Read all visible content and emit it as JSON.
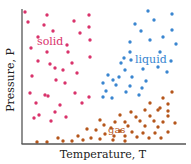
{
  "colors": {
    "solid": "#d9336b",
    "liquid": "#3a86d0",
    "gas": "#b5561b",
    "axis": "#555555",
    "text": "#222222"
  },
  "labels": {
    "solid": "solid",
    "liquid": "liquid",
    "gas": "gas"
  },
  "chart_data": {
    "type": "scatter",
    "title": "",
    "xlabel": "Temperature, T",
    "ylabel": "Pressure, P",
    "grid": false,
    "legend": "in-plot text labels",
    "series": [
      {
        "name": "solid",
        "points": [
          [
            25,
            12
          ],
          [
            47,
            15
          ],
          [
            89,
            15
          ],
          [
            28,
            22
          ],
          [
            44,
            25
          ],
          [
            74,
            21
          ],
          [
            89,
            27
          ],
          [
            53,
            31
          ],
          [
            80,
            33
          ],
          [
            38,
            37
          ],
          [
            67,
            45
          ],
          [
            90,
            40
          ],
          [
            31,
            48
          ],
          [
            47,
            52
          ],
          [
            68,
            52
          ],
          [
            90,
            57
          ],
          [
            38,
            61
          ],
          [
            50,
            64
          ],
          [
            72,
            63
          ],
          [
            55,
            68
          ],
          [
            63,
            70
          ],
          [
            77,
            73
          ],
          [
            32,
            76
          ],
          [
            56,
            80
          ],
          [
            65,
            83
          ],
          [
            30,
            93
          ],
          [
            45,
            95
          ],
          [
            75,
            93
          ],
          [
            48,
            96
          ],
          [
            36,
            103
          ],
          [
            60,
            105
          ],
          [
            82,
            103
          ],
          [
            89,
            97
          ],
          [
            55,
            112
          ],
          [
            39,
            115
          ],
          [
            34,
            118
          ],
          [
            66,
            117
          ],
          [
            51,
            121
          ]
        ]
      },
      {
        "name": "liquid",
        "points": [
          [
            148,
            11
          ],
          [
            172,
            14
          ],
          [
            154,
            20
          ],
          [
            135,
            24
          ],
          [
            141,
            31
          ],
          [
            172,
            30
          ],
          [
            150,
            40
          ],
          [
            163,
            37
          ],
          [
            130,
            42
          ],
          [
            176,
            44
          ],
          [
            130,
            52
          ],
          [
            160,
            52
          ],
          [
            124,
            58
          ],
          [
            131,
            60
          ],
          [
            171,
            61
          ],
          [
            121,
            63
          ],
          [
            143,
            69
          ],
          [
            125,
            70
          ],
          [
            158,
            67
          ],
          [
            167,
            72
          ],
          [
            108,
            75
          ],
          [
            119,
            77
          ],
          [
            132,
            77
          ],
          [
            146,
            81
          ],
          [
            113,
            80
          ],
          [
            103,
            83
          ],
          [
            116,
            85
          ],
          [
            130,
            86
          ],
          [
            142,
            88
          ],
          [
            106,
            91
          ],
          [
            126,
            92
          ],
          [
            139,
            95
          ],
          [
            103,
            97
          ],
          [
            112,
            98
          ]
        ]
      },
      {
        "name": "gas",
        "points": [
          [
            172,
            92
          ],
          [
            163,
            98
          ],
          [
            168,
            104
          ],
          [
            150,
            103
          ],
          [
            160,
            108
          ],
          [
            131,
            112
          ],
          [
            145,
            110
          ],
          [
            158,
            110
          ],
          [
            168,
            111
          ],
          [
            120,
            115
          ],
          [
            136,
            117
          ],
          [
            150,
            116
          ],
          [
            168,
            116
          ],
          [
            100,
            120
          ],
          [
            115,
            122
          ],
          [
            125,
            122
          ],
          [
            140,
            121
          ],
          [
            154,
            121
          ],
          [
            163,
            122
          ],
          [
            175,
            123
          ],
          [
            104,
            125
          ],
          [
            128,
            126
          ],
          [
            145,
            126
          ],
          [
            158,
            127
          ],
          [
            111,
            128
          ],
          [
            87,
            129
          ],
          [
            96,
            130
          ],
          [
            120,
            131
          ],
          [
            132,
            132
          ],
          [
            143,
            133
          ],
          [
            155,
            133
          ],
          [
            168,
            132
          ],
          [
            105,
            134
          ],
          [
            114,
            136
          ],
          [
            125,
            136
          ],
          [
            137,
            137
          ],
          [
            149,
            138
          ],
          [
            161,
            138
          ],
          [
            78,
            136
          ],
          [
            91,
            138
          ],
          [
            100,
            139
          ],
          [
            113,
            140
          ],
          [
            125,
            141
          ],
          [
            83,
            140
          ],
          [
            72,
            141
          ],
          [
            63,
            141
          ],
          [
            58,
            138
          ],
          [
            47,
            142
          ],
          [
            37,
            142
          ]
        ]
      }
    ],
    "xlim": [
      0,
      1
    ],
    "ylim": [
      0,
      1
    ],
    "annotations": [
      {
        "text": "solid",
        "x": 38,
        "y": 44
      },
      {
        "text": "liquid",
        "x": 136,
        "y": 62
      },
      {
        "text": "gas",
        "x": 110,
        "y": 132
      }
    ]
  },
  "axes": {
    "xlabel": "Temperature, T",
    "ylabel": "Pressure, P"
  }
}
